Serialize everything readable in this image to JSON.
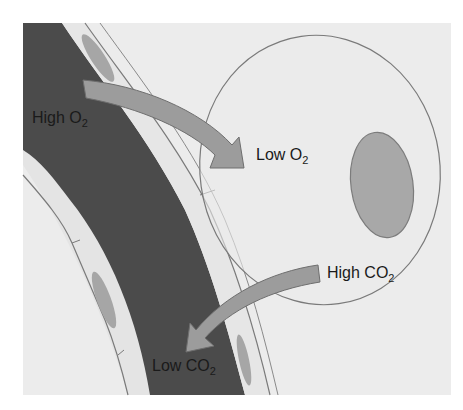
{
  "diagram": {
    "colors": {
      "background": "#ffffff",
      "panel": "#ececec",
      "vessel_lumen": "#4b4b4b",
      "vessel_wall": "#e6e6e6",
      "outline": "#7a7a7a",
      "wall_nucleus": "#a6a6a6",
      "cell_fill": "#ebebeb",
      "cell_nucleus": "#a8a8a8",
      "arrow_fill": "#9c9c9c",
      "arrow_stroke": "#6e6e6e",
      "text": "#1a1a1a"
    },
    "labels": {
      "high_o2": {
        "text": "High O",
        "sub": "2"
      },
      "low_o2": {
        "text": "Low O",
        "sub": "2"
      },
      "high_co2": {
        "text": "High CO",
        "sub": "2"
      },
      "low_co2": {
        "text": "Low CO",
        "sub": "2"
      }
    },
    "arrows": [
      {
        "from": "High O2",
        "to": "Low O2",
        "direction": "vessel-to-cell"
      },
      {
        "from": "High CO2",
        "to": "Low CO2",
        "direction": "cell-to-vessel"
      }
    ],
    "structures": [
      "blood vessel (capillary)",
      "endothelial wall cells",
      "tissue cell",
      "cell nucleus"
    ]
  }
}
